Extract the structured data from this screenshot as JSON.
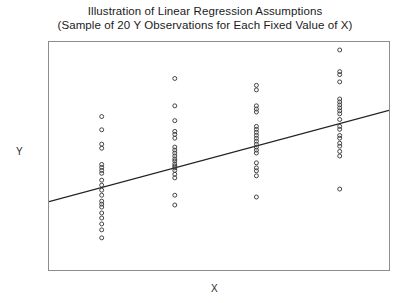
{
  "chart_data": {
    "type": "scatter",
    "title": "Illustration of Linear Regression Assumptions",
    "subtitle": "(Sample of 20 Y Observations for Each Fixed Value of X)",
    "title_lines": [
      "Illustration of Linear Regression Assumptions",
      "(Sample of 20 Y Observations for Each Fixed Value of X)"
    ],
    "xlabel": "X",
    "ylabel": "Y",
    "grid": false,
    "legend": false,
    "xlim": [
      0,
      10
    ],
    "ylim": [
      0,
      10
    ],
    "xticks": [],
    "yticks": [],
    "marker": "open-circle",
    "marker_size": 4,
    "series": [
      {
        "name": "Observations at X = 1",
        "x": 1.55,
        "values": [
          6.73,
          6.15,
          5.52,
          5.34,
          4.63,
          4.5,
          4.37,
          4.24,
          3.94,
          3.72,
          3.5,
          3.28,
          3.02,
          2.89,
          2.76,
          2.5,
          2.28,
          2.02,
          1.76,
          1.41
        ]
      },
      {
        "name": "Observations at X = 2",
        "x": 3.7,
        "values": [
          8.4,
          7.2,
          6.55,
          6.08,
          5.95,
          5.78,
          5.39,
          5.26,
          5.13,
          5.0,
          4.87,
          4.78,
          4.65,
          4.56,
          4.48,
          4.37,
          4.2,
          4.04,
          3.28,
          2.85
        ]
      },
      {
        "name": "Observations at X = 3",
        "x": 6.1,
        "values": [
          8.1,
          7.9,
          7.2,
          7.06,
          6.93,
          6.3,
          6.17,
          6.04,
          5.91,
          5.78,
          5.65,
          5.52,
          5.39,
          5.26,
          5.13,
          4.7,
          4.48,
          4.35,
          4.13,
          3.2
        ]
      },
      {
        "name": "Observations at X = 4",
        "x": 8.55,
        "values": [
          9.65,
          8.7,
          8.57,
          8.25,
          7.5,
          7.37,
          7.24,
          7.11,
          6.98,
          6.85,
          6.6,
          6.3,
          6.17,
          5.9,
          5.78,
          5.56,
          5.43,
          5.2,
          5.0,
          3.55
        ]
      },
      {
        "name": "Observations at X = 5",
        "x": 10.25,
        "values": [
          10.1,
          9.82,
          9.56,
          9.35,
          9.15,
          8.6,
          8.47,
          8.35,
          8.23,
          8.1,
          7.97,
          7.84,
          7.6,
          7.3,
          7.0,
          6.85,
          6.55,
          6.4,
          6.0,
          5.65
        ]
      }
    ],
    "regression_line": {
      "name": "Population Regression Line",
      "slope": 0.4,
      "intercept": 3.0,
      "x_start": 0,
      "y_start": 3.0,
      "x_end": 10,
      "y_end": 7.0,
      "color": "#222222"
    },
    "colors": {
      "marker_stroke": "#3a3a3a",
      "frame": "#8d8d8d",
      "line": "#222222",
      "background": "#ffffff",
      "text": "#1a1a1a"
    }
  }
}
